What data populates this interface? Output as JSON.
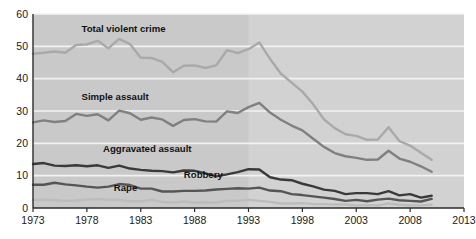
{
  "chart_data": {
    "type": "line",
    "title": "",
    "xlabel": "",
    "ylabel": "",
    "xlim": [
      1973,
      2013
    ],
    "ylim": [
      0,
      60
    ],
    "grid": true,
    "legend_position": "inline-labels",
    "x_ticks": [
      "1973",
      "1978",
      "1983",
      "1988",
      "1993",
      "1998",
      "2003",
      "2008",
      "2013"
    ],
    "y_ticks": [
      "0",
      "10",
      "20",
      "30",
      "40",
      "50",
      "60"
    ],
    "x": [
      1973,
      1974,
      1975,
      1976,
      1977,
      1978,
      1979,
      1980,
      1981,
      1982,
      1983,
      1984,
      1985,
      1986,
      1987,
      1988,
      1989,
      1990,
      1991,
      1992,
      1993,
      1994,
      1995,
      1996,
      1997,
      1998,
      1999,
      2000,
      2001,
      2002,
      2003,
      2004,
      2005,
      2006,
      2007,
      2008,
      2009,
      2010
    ],
    "shaded_region": {
      "from": 1993,
      "to": 2013,
      "color": "#d2d2d2"
    },
    "plot_background": "#c9c9c9",
    "series": [
      {
        "name": "Total violent crime",
        "color": "#a9a9a9",
        "label_x": 1977.5,
        "label_y": 54.5,
        "values": [
          47.7,
          48.0,
          48.4,
          48.0,
          50.4,
          50.6,
          51.7,
          49.4,
          52.3,
          50.7,
          46.5,
          46.4,
          45.2,
          42.0,
          44.0,
          44.1,
          43.3,
          44.1,
          48.8,
          47.9,
          49.1,
          51.2,
          46.1,
          41.6,
          38.8,
          36.0,
          32.1,
          27.4,
          24.7,
          22.8,
          22.3,
          21.1,
          21.2,
          25.0,
          20.7,
          19.3,
          17.1,
          14.9
        ]
      },
      {
        "name": "Simple assault",
        "color": "#808080",
        "label_x": 1977.5,
        "label_y": 33.5,
        "values": [
          26.5,
          27.1,
          26.6,
          26.9,
          29.1,
          28.5,
          29.0,
          27.1,
          30.1,
          29.3,
          27.3,
          28.0,
          27.4,
          25.4,
          27.2,
          27.5,
          26.8,
          26.7,
          29.9,
          29.4,
          31.2,
          32.5,
          29.5,
          27.3,
          25.5,
          24.0,
          21.4,
          18.9,
          17.0,
          16.0,
          15.5,
          14.9,
          15.0,
          17.7,
          15.3,
          14.3,
          12.9,
          11.2
        ]
      },
      {
        "name": "Aggravated assault",
        "color": "#3a3a3a",
        "label_x": 1979.5,
        "label_y": 17.2,
        "values": [
          13.6,
          13.9,
          13.1,
          13.0,
          13.2,
          12.9,
          13.2,
          12.4,
          13.1,
          12.2,
          11.8,
          11.5,
          11.4,
          11.0,
          11.6,
          11.5,
          10.7,
          9.8,
          10.4,
          11.1,
          12.0,
          11.9,
          9.5,
          8.8,
          8.6,
          7.5,
          6.7,
          5.7,
          5.3,
          4.3,
          4.6,
          4.6,
          4.3,
          5.2,
          3.9,
          4.3,
          3.2,
          3.8
        ]
      },
      {
        "name": "Robbery",
        "color": "#555555",
        "label_x": 1987.0,
        "label_y": 9.2,
        "values": [
          7.2,
          7.2,
          7.8,
          7.3,
          7.0,
          6.6,
          6.3,
          6.6,
          7.4,
          7.1,
          6.0,
          6.0,
          5.1,
          5.1,
          5.3,
          5.3,
          5.4,
          5.7,
          5.9,
          6.1,
          6.0,
          6.3,
          5.4,
          5.2,
          4.3,
          4.0,
          3.6,
          3.2,
          2.8,
          2.2,
          2.5,
          2.1,
          2.6,
          2.9,
          2.4,
          2.2,
          2.0,
          2.8
        ]
      },
      {
        "name": "Rape",
        "color": "#bcbcbc",
        "label_x": 1980.5,
        "label_y": 5.4,
        "values": [
          2.5,
          2.6,
          2.4,
          2.2,
          2.3,
          2.6,
          2.8,
          2.5,
          2.5,
          2.1,
          2.1,
          2.5,
          1.9,
          1.7,
          2.0,
          1.7,
          1.8,
          1.7,
          2.2,
          2.2,
          2.5,
          2.2,
          1.9,
          1.4,
          1.4,
          1.5,
          1.2,
          1.2,
          1.1,
          1.1,
          0.8,
          0.9,
          0.8,
          1.4,
          1.0,
          0.8,
          0.8,
          1.0
        ]
      }
    ]
  }
}
